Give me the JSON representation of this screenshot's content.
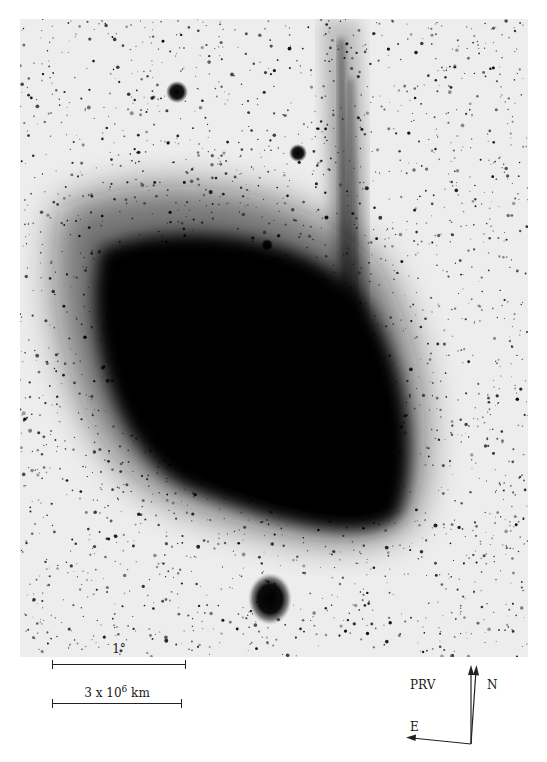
{
  "image": {
    "description": "Negative photographic plate of a comet with a broad fan-shaped coma and a narrow ion tail extending upward",
    "background_color": "#ececec",
    "coma_color": "#000000",
    "features": [
      {
        "name": "coma",
        "shape": "fan",
        "position": "center"
      },
      {
        "name": "ion-tail",
        "shape": "narrow streaks",
        "position": "upper-center-right"
      },
      {
        "name": "bright-star-1",
        "position": "upper-left"
      },
      {
        "name": "bright-star-2",
        "position": "upper-center"
      },
      {
        "name": "bright-star-3",
        "position": "bottom-center"
      }
    ]
  },
  "scale_bars": [
    {
      "label": "1°",
      "unit": "angular"
    },
    {
      "label_base": "3 x 10",
      "label_exp": "6",
      "label_unit": "km",
      "unit": "distance"
    }
  ],
  "compass": {
    "labels": {
      "prv": "PRV",
      "north": "N",
      "east": "E"
    }
  }
}
